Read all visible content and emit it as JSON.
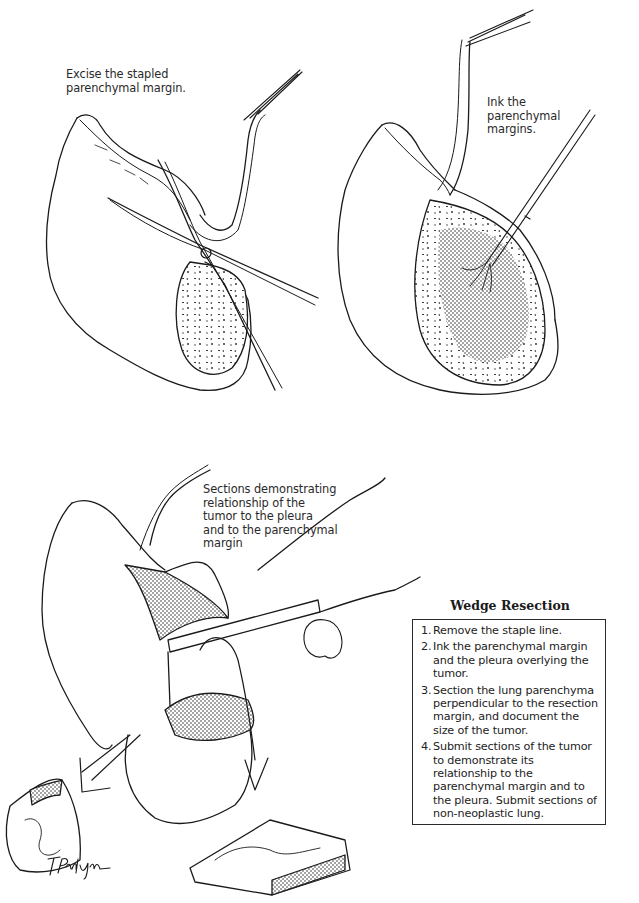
{
  "figure": {
    "panels": [
      {
        "id": "excise",
        "caption": "Excise the stapled\nparenchymal margin."
      },
      {
        "id": "ink",
        "caption": "Ink the\nparenchymal\nmargins."
      },
      {
        "id": "section",
        "caption": "Sections demonstrating\nrelationship of the\ntumor to the pleura\nand to the parenchymal\nmargin"
      }
    ],
    "signature": "T. Phelps"
  },
  "procedure_box": {
    "title": "Wedge Resection",
    "steps": [
      {
        "num": "1.",
        "text": "Remove the staple line."
      },
      {
        "num": "2.",
        "text": "Ink the parenchymal margin and the pleura overlying the tumor."
      },
      {
        "num": "3.",
        "text": "Section the lung parenchyma perpendicular to the resection margin, and document the size of the tumor."
      },
      {
        "num": "4.",
        "text": "Submit sections of the tumor to demonstrate its relationship to the parenchymal margin and to the pleura. Submit sections of non-neoplastic lung."
      }
    ]
  },
  "colors": {
    "ink": "#1a1a1a",
    "background": "#ffffff"
  }
}
